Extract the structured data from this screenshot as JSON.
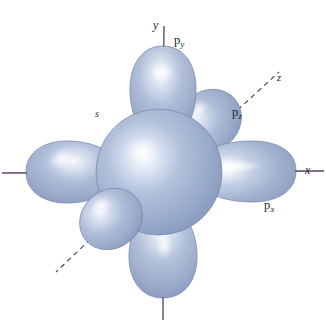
{
  "figure": {
    "background_color": "#ffffff",
    "width": 326,
    "height": 330
  },
  "axes": {
    "x": {
      "label": "x",
      "line_color": "#6b4a6b",
      "style": "solid",
      "orientation": "horizontal"
    },
    "y": {
      "label": "y",
      "line_color": "#6b6b7a",
      "style": "solid",
      "orientation": "vertical"
    },
    "z": {
      "label": "z",
      "line_color": "#55555f",
      "style": "dashed",
      "orientation": "diagonal"
    }
  },
  "orbitals": [
    {
      "id": "s",
      "label": "s",
      "sub": "",
      "shape": "sphere",
      "color": "#9fb0cf"
    },
    {
      "id": "px",
      "label": "p",
      "sub": "x",
      "shape": "dumbbell",
      "color": "#9fb0cf"
    },
    {
      "id": "py",
      "label": "p",
      "sub": "y",
      "shape": "dumbbell",
      "color": "#9fb0cf"
    },
    {
      "id": "pz",
      "label": "p",
      "sub": "z",
      "shape": "dumbbell",
      "color": "#9fb0cf"
    }
  ],
  "labels": {
    "y_axis": "y",
    "x_axis": "x",
    "z_axis": "z",
    "s_orbital": "s",
    "p_base": "p",
    "py_sub": "y",
    "pz_sub": "z",
    "px_sub": "x"
  },
  "colors": {
    "orbital_base": "#9fb0cf",
    "orbital_light": "#ccd8ea",
    "orbital_highlight": "#f2f6fc",
    "orbital_shadow": "#7e90b4",
    "orbital_edge": "#6f80a6",
    "axis_purple": "#6b4a6b",
    "axis_gray": "#6b6b7a",
    "text": "#23232b",
    "background": "#ffffff"
  }
}
